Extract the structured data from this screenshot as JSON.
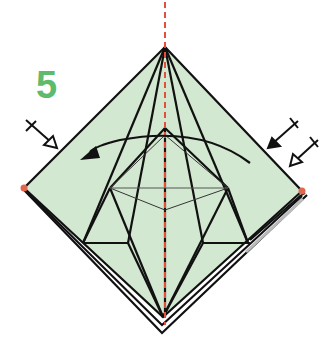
{
  "diagram": {
    "step_number": "5",
    "colors": {
      "paper_fill": "#d3e8d0",
      "line": "#111111",
      "center_crease": "#e0503a",
      "corner_dot": "#e0664e",
      "step_number": "#5dbb6e",
      "background": "#ffffff"
    },
    "elements": [
      {
        "id": "paper-square",
        "type": "diamond",
        "vertices": {
          "top": [
            165,
            47
          ],
          "right": [
            302,
            191
          ],
          "bottom": [
            163,
            317
          ],
          "left": [
            24,
            188
          ]
        }
      },
      {
        "id": "back-layer-edges",
        "type": "offset-edges",
        "description": "double outline along lower-left and lower-right edges"
      },
      {
        "id": "center-valley-line",
        "type": "dashed-line",
        "from": [
          165,
          0
        ],
        "to": [
          165,
          325
        ]
      },
      {
        "id": "inner-diamond",
        "type": "thin-diamond",
        "vertices": {
          "top": [
            165,
            135
          ],
          "right": [
            228,
            188
          ],
          "bottom": [
            165,
            210
          ],
          "left": [
            110,
            188
          ]
        }
      },
      {
        "id": "curved-arrow",
        "type": "arrow",
        "direction": "right-to-left",
        "from": [
          250,
          165
        ],
        "to": [
          82,
          160
        ]
      },
      {
        "id": "pinch-arrow-left",
        "type": "push-arrow",
        "position": [
          35,
          130
        ]
      },
      {
        "id": "fold-arrow-right",
        "type": "fold-arrow",
        "position": [
          285,
          130
        ]
      },
      {
        "id": "push-arrow-right",
        "type": "push-arrow",
        "position": [
          305,
          150
        ]
      },
      {
        "id": "corner-dot-left",
        "type": "dot",
        "position": [
          24,
          188
        ]
      },
      {
        "id": "corner-dot-right",
        "type": "dot",
        "position": [
          302,
          191
        ]
      }
    ]
  }
}
